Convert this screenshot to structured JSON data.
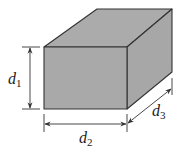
{
  "diagram": {
    "colors": {
      "front_face": "#a9a9a9",
      "top_face": "#ababab",
      "side_face": "#a7a7a7",
      "outline": "#333333",
      "text": "#222222"
    },
    "dimensions": [
      {
        "id": "d1",
        "symbol": "d",
        "subscript": "1",
        "meaning": "height"
      },
      {
        "id": "d2",
        "symbol": "d",
        "subscript": "2",
        "meaning": "width"
      },
      {
        "id": "d3",
        "symbol": "d",
        "subscript": "3",
        "meaning": "depth"
      }
    ]
  }
}
